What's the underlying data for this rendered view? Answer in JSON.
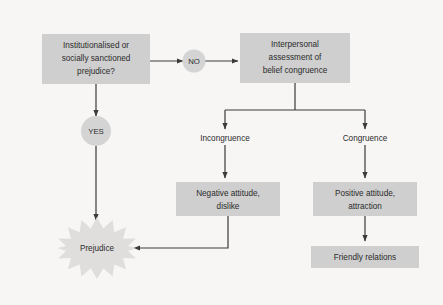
{
  "diagram": {
    "background_color": "#f7f6f5",
    "box_color": "#cfcfcf",
    "circle_color": "#d4d4d4",
    "burst_color": "#e0dedd",
    "line_color": "#3a3a3a",
    "text_color": "#2b2b2b"
  },
  "nodes": {
    "question": {
      "shape": "rectangle",
      "line1": "Institutionalised or",
      "line2": "socially sanctioned",
      "line3": "prejudice?"
    },
    "no": {
      "shape": "circle",
      "label": "NO"
    },
    "yes": {
      "shape": "circle",
      "label": "YES"
    },
    "assessment": {
      "shape": "rectangle",
      "line1": "Interpersonal",
      "line2": "assessment of",
      "line3": "belief congruence"
    },
    "incongruence": {
      "shape": "label",
      "label": "Incongruence"
    },
    "congruence": {
      "shape": "label",
      "label": "Congruence"
    },
    "negative": {
      "shape": "rectangle",
      "line1": "Negative attitude,",
      "line2": "dislike"
    },
    "positive": {
      "shape": "rectangle",
      "line1": "Positive attitude,",
      "line2": "attraction"
    },
    "friendly": {
      "shape": "rectangle",
      "label": "Friendly relations"
    },
    "prejudice": {
      "shape": "starburst",
      "label": "Prejudice"
    }
  },
  "edges": [
    {
      "from": "question",
      "to": "no",
      "type": "arrow-right"
    },
    {
      "from": "no",
      "to": "assessment",
      "type": "arrow-right"
    },
    {
      "from": "question",
      "to": "yes",
      "type": "arrow-down"
    },
    {
      "from": "yes",
      "to": "prejudice",
      "type": "arrow-down"
    },
    {
      "from": "assessment",
      "to": "incongruence",
      "type": "arrow-split-left"
    },
    {
      "from": "assessment",
      "to": "congruence",
      "type": "arrow-split-right"
    },
    {
      "from": "incongruence",
      "to": "negative",
      "type": "arrow-down"
    },
    {
      "from": "congruence",
      "to": "positive",
      "type": "arrow-down"
    },
    {
      "from": "negative",
      "to": "prejudice",
      "type": "arrow-elbow-left"
    },
    {
      "from": "positive",
      "to": "friendly",
      "type": "arrow-down"
    }
  ]
}
